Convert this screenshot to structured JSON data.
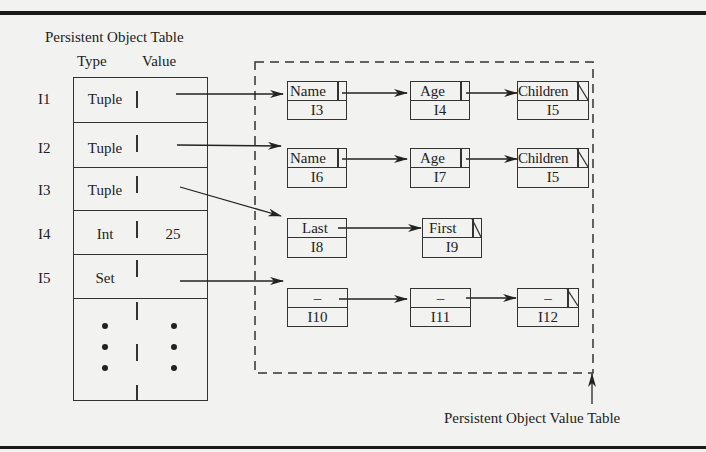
{
  "figure": {
    "left_title": "Persistent Object Table",
    "column_headers": {
      "type": "Type",
      "value": "Value"
    },
    "right_caption": "Persistent Object Value Table"
  },
  "object_table": {
    "rows": [
      {
        "id": "I1",
        "type": "Tuple",
        "value": ""
      },
      {
        "id": "I2",
        "type": "Tuple",
        "value": ""
      },
      {
        "id": "I3",
        "type": "Tuple",
        "value": ""
      },
      {
        "id": "I4",
        "type": "Int",
        "value": "25"
      },
      {
        "id": "I5",
        "type": "Set",
        "value": ""
      }
    ],
    "continuation": "..."
  },
  "value_table": {
    "chains": [
      {
        "from": "I1",
        "cells": [
          {
            "label": "Name",
            "ref": "I3"
          },
          {
            "label": "Age",
            "ref": "I4"
          },
          {
            "label": "Children",
            "ref": "I5",
            "null_ptr": true
          }
        ]
      },
      {
        "from": "I2",
        "cells": [
          {
            "label": "Name",
            "ref": "I6"
          },
          {
            "label": "Age",
            "ref": "I7"
          },
          {
            "label": "Children",
            "ref": "I5",
            "null_ptr": true
          }
        ]
      },
      {
        "from": "I3",
        "cells": [
          {
            "label": "Last",
            "ref": "I8"
          },
          {
            "label": "First",
            "ref": "I9",
            "null_ptr": true
          }
        ]
      },
      {
        "from": "I5",
        "cells": [
          {
            "label": "–",
            "ref": "I10"
          },
          {
            "label": "–",
            "ref": "I11"
          },
          {
            "label": "–",
            "ref": "I12",
            "null_ptr": true
          }
        ]
      }
    ]
  }
}
